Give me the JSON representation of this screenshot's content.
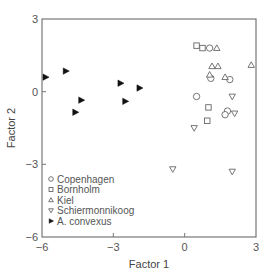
{
  "chart_data": {
    "type": "scatter",
    "title": "",
    "xlabel": "Factor 1",
    "ylabel": "Factor 2",
    "xlim": [
      -6,
      3
    ],
    "ylim": [
      -6,
      3
    ],
    "xticks": [
      -6,
      -3,
      0,
      3
    ],
    "yticks": [
      -6,
      -3,
      0,
      3
    ],
    "xtick_labels": [
      "−6",
      "−3",
      "0",
      "3"
    ],
    "ytick_labels": [
      "−6",
      "−3",
      "0",
      "3"
    ],
    "grid": false,
    "legend_position": "lower left",
    "series": [
      {
        "name": "Copenhagen",
        "marker": "circle-open",
        "points": [
          [
            1.05,
            1.8
          ],
          [
            1.1,
            0.55
          ],
          [
            1.9,
            0.5
          ],
          [
            0.5,
            -0.2
          ],
          [
            1.8,
            -0.8
          ],
          [
            1.7,
            -0.95
          ]
        ]
      },
      {
        "name": "Bornholm",
        "marker": "square-open",
        "points": [
          [
            0.5,
            1.9
          ],
          [
            0.75,
            1.8
          ],
          [
            1.0,
            -0.65
          ],
          [
            0.95,
            -1.2
          ]
        ]
      },
      {
        "name": "Kiel",
        "marker": "triangle-up-open",
        "points": [
          [
            1.35,
            1.8
          ],
          [
            1.15,
            1.05
          ],
          [
            1.4,
            1.05
          ],
          [
            1.05,
            0.7
          ],
          [
            1.7,
            0.6
          ],
          [
            2.8,
            1.1
          ]
        ]
      },
      {
        "name": "Schiermonnikoog",
        "marker": "triangle-down-open",
        "points": [
          [
            2.0,
            -0.2
          ],
          [
            2.1,
            -0.9
          ],
          [
            0.4,
            -1.5
          ],
          [
            -0.5,
            -3.2
          ],
          [
            2.0,
            -3.3
          ]
        ]
      },
      {
        "name": "A. convexus",
        "marker": "triangle-right-filled",
        "points": [
          [
            -5.85,
            0.6
          ],
          [
            -5.0,
            0.85
          ],
          [
            -4.35,
            -0.35
          ],
          [
            -4.6,
            -0.85
          ],
          [
            -2.7,
            0.35
          ],
          [
            -2.5,
            -0.4
          ],
          [
            -1.9,
            0.15
          ]
        ]
      }
    ]
  }
}
